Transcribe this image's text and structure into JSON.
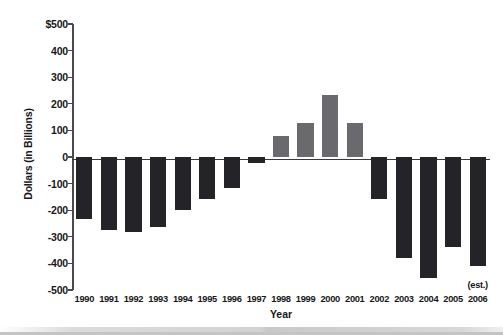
{
  "chart_data": {
    "type": "bar",
    "title": "",
    "xlabel": "Year",
    "ylabel": "Dollars (in Billions)",
    "categories": [
      "1990",
      "1991",
      "1992",
      "1993",
      "1994",
      "1995",
      "1996",
      "1997",
      "1998",
      "1999",
      "2000",
      "2001",
      "2002",
      "2003",
      "2004",
      "2005",
      "2006"
    ],
    "values": [
      -233,
      -274,
      -281,
      -263,
      -200,
      -159,
      -115,
      -22,
      78,
      126,
      233,
      126,
      -159,
      -378,
      -456,
      -340,
      -411
    ],
    "ylim": [
      -500,
      500
    ],
    "yticks": [
      500,
      400,
      300,
      200,
      100,
      0,
      -100,
      -200,
      -300,
      -400,
      -500
    ],
    "ytick_labels": [
      "$500",
      "400",
      "300",
      "200",
      "100",
      "0",
      "-100",
      "-200",
      "-300",
      "-400",
      "-500"
    ],
    "grid": false,
    "legend": null,
    "annotations": [
      {
        "text": "(est.)",
        "category": "2006"
      }
    ],
    "series_colors": {
      "negative": "#242428",
      "positive": "#6a6a6e"
    }
  },
  "axis": {
    "y_title": "Dollars (in Billions)",
    "x_title": "Year"
  },
  "annotation": {
    "est_label": "(est.)"
  }
}
